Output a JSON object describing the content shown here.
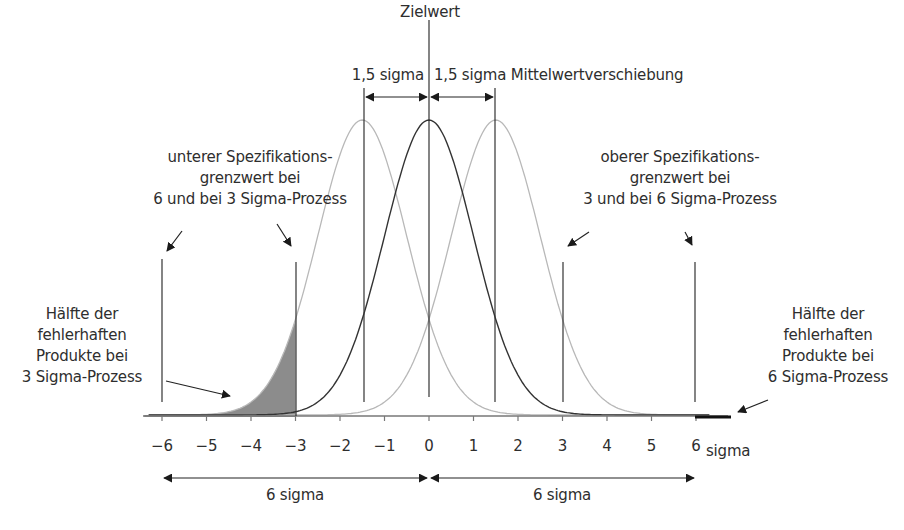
{
  "title": "Zielwert",
  "top_annotations": {
    "left_shift_label": "1,5 sigma",
    "right_shift_label": "1,5 sigma Mittelwertverschiebung"
  },
  "lower_spec": {
    "lines": [
      "unterer Spezifikations-",
      "grenzwert bei",
      "6 und bei 3 Sigma-Prozess"
    ]
  },
  "upper_spec": {
    "lines": [
      "oberer Spezifikations-",
      "grenzwert bei",
      "3 und bei 6 Sigma-Prozess"
    ]
  },
  "left_defects": {
    "lines": [
      "Hälfte der",
      "fehlerhaften",
      "Produkte bei",
      "3 Sigma-Prozess"
    ]
  },
  "right_defects": {
    "lines": [
      "Hälfte der",
      "fehlerhaften",
      "Produkte bei",
      "6 Sigma-Prozess"
    ]
  },
  "axis": {
    "ticks": [
      "−6",
      "−5",
      "−4",
      "−3",
      "−2",
      "−1",
      "0",
      "1",
      "2",
      "3",
      "4",
      "5",
      "6"
    ],
    "unit_label": "sigma"
  },
  "bottom_spans": {
    "left_label": "6 sigma",
    "right_label": "6 sigma"
  },
  "chart_data": {
    "type": "line",
    "title": "Zielwert",
    "xlabel": "sigma",
    "x_range": [
      -6,
      6
    ],
    "series": [
      {
        "name": "centered process",
        "mean": 0,
        "sd": 1,
        "color": "#333333"
      },
      {
        "name": "shifted -1.5 sigma",
        "mean": -1.5,
        "sd": 1,
        "color": "#b8b8b8"
      },
      {
        "name": "shifted +1.5 sigma",
        "mean": 1.5,
        "sd": 1,
        "color": "#b8b8b8"
      }
    ],
    "spec_limits": [
      -6,
      -3,
      3,
      6
    ],
    "shaded_region": {
      "from": -6,
      "to": -3,
      "under_series": "shifted -1.5 sigma",
      "color": "#8c8c8c"
    },
    "mean_shift": 1.5
  }
}
